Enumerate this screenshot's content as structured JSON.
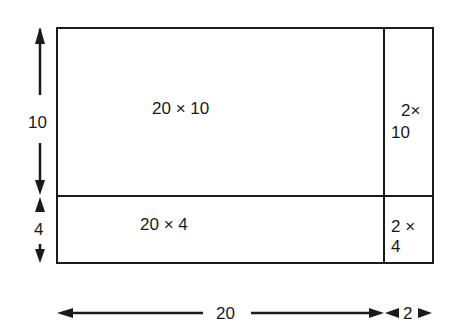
{
  "diagram": {
    "type": "area-model",
    "regions": {
      "top_left": "20 × 10",
      "top_right_line1": "2×",
      "top_right_line2": "10",
      "bottom_left": "20 × 4",
      "bottom_right_line1": "2 ×",
      "bottom_right_line2": "4"
    },
    "dimensions": {
      "height_top": "10",
      "height_bottom": "4",
      "width_left": "20",
      "width_right": "2"
    },
    "colors": {
      "stroke": "#1a1a1a",
      "background": "#ffffff"
    }
  }
}
